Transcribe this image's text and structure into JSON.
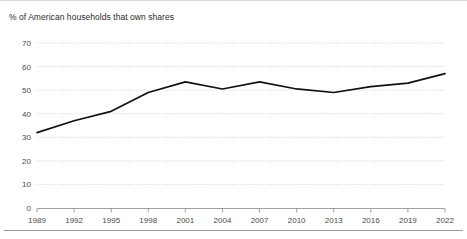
{
  "chart_data": {
    "type": "line",
    "title": "% of American households that own shares",
    "xlabel": "",
    "ylabel": "",
    "x": [
      1989,
      1992,
      1995,
      1998,
      2001,
      2004,
      2007,
      2010,
      2013,
      2016,
      2019,
      2022
    ],
    "values": [
      32,
      37,
      41,
      49,
      53.5,
      50.5,
      53.5,
      50.5,
      49,
      51.5,
      53,
      57
    ],
    "series": [
      {
        "name": "% of American households that own shares",
        "values": [
          32,
          37,
          41,
          49,
          53.5,
          50.5,
          53.5,
          50.5,
          49,
          51.5,
          53,
          57
        ]
      }
    ],
    "xtick_labels": [
      "1989",
      "1992",
      "1995",
      "1998",
      "2001",
      "2004",
      "2007",
      "2010",
      "2013",
      "2016",
      "2019",
      "2022"
    ],
    "ytick_labels": [
      "0",
      "10",
      "20",
      "30",
      "40",
      "50",
      "60",
      "70"
    ],
    "ytick_values": [
      0,
      10,
      20,
      30,
      40,
      50,
      60,
      70
    ],
    "ylim": [
      0,
      70
    ],
    "xlim": [
      1989,
      2022
    ],
    "grid": true,
    "legend": false,
    "line_color": "#111111",
    "grid_color": "#bdbdbd",
    "axis_color": "#8c8c8c",
    "text_color": "#4a4a4a"
  }
}
